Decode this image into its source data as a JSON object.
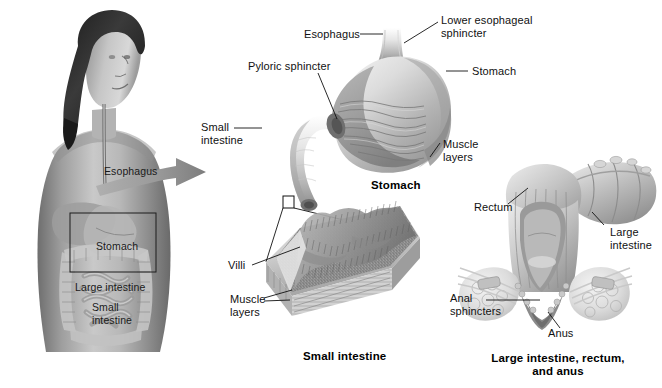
{
  "figure": {
    "background_color": "#ffffff",
    "ink_color": "#111111"
  },
  "panels": {
    "body": {
      "name": "Female torso with digestive organs",
      "labels": [
        {
          "id": "esophagus",
          "text": "Esophagus",
          "x": 104,
          "y": 165
        },
        {
          "id": "stomach",
          "text": "Stomach",
          "x": 96,
          "y": 240
        },
        {
          "id": "large_intestine",
          "text": "Large intestine",
          "x": 75,
          "y": 281
        },
        {
          "id": "small_intestine",
          "text": "Small\nintestine",
          "x": 92,
          "y": 301
        }
      ],
      "callout_box": {
        "x": 70,
        "y": 213,
        "width": 86,
        "height": 59
      }
    },
    "stomach": {
      "name": "Stomach cutaway",
      "caption": "Stomach",
      "caption_x": 371,
      "caption_y": 181,
      "labels": [
        {
          "id": "esophagus",
          "text": "Esophagus",
          "x": 304,
          "y": 30
        },
        {
          "id": "lower_esophageal_sphincter",
          "text": "Lower esophageal\nsphincter",
          "x": 441,
          "y": 17
        },
        {
          "id": "pyloric_sphincter",
          "text": "Pyloric sphincter",
          "x": 248,
          "y": 62
        },
        {
          "id": "stomach_pointer",
          "text": "Stomach",
          "x": 472,
          "y": 68
        },
        {
          "id": "small_intestine",
          "text": "Small\nintestine",
          "x": 201,
          "y": 123
        },
        {
          "id": "muscle_layers",
          "text": "Muscle\nlayers",
          "x": 443,
          "y": 140
        }
      ]
    },
    "small_intestine": {
      "name": "Small intestine wall cutaway with villi",
      "caption": "Small intestine",
      "caption_x": 303,
      "caption_y": 352,
      "labels": [
        {
          "id": "villi",
          "text": "Villi",
          "x": 228,
          "y": 261
        },
        {
          "id": "muscle_layers",
          "text": "Muscle\nlayers",
          "x": 230,
          "y": 297
        }
      ],
      "magnifier_box": {
        "x": 283,
        "y": 196,
        "width": 11,
        "height": 12
      }
    },
    "large_intestine": {
      "name": "Large intestine, rectum and anus",
      "caption": "Large intestine, rectum,\nand anus",
      "caption_x": 558,
      "caption_y": 354,
      "labels": [
        {
          "id": "rectum",
          "text": "Rectum",
          "x": 474,
          "y": 203
        },
        {
          "id": "large_intestine",
          "text": "Large\nintestine",
          "x": 614,
          "y": 229
        },
        {
          "id": "anal_sphincters",
          "text": "Anal\nsphincters",
          "x": 450,
          "y": 294
        },
        {
          "id": "anus",
          "text": "Anus",
          "x": 548,
          "y": 329
        }
      ]
    }
  },
  "pointer_arrow": {
    "name": "magnification-arrow",
    "from_panel": "body",
    "to_panel": "stomach",
    "color": "#8d8d8d"
  }
}
